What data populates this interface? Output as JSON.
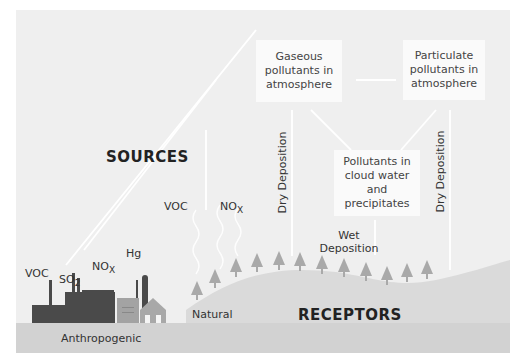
{
  "diagram": {
    "title_sources": "SOURCES",
    "title_receptors": "RECEPTORS",
    "boxes": {
      "gaseous": "Gaseous pollutants in atmosphere",
      "particulate": "Particulate pollutants in atmosphere",
      "cloud": "Pollutants in cloud water and precipitates"
    },
    "deposition": {
      "dry_left": "Dry Deposition",
      "dry_right": "Dry Deposition",
      "wet_line1": "Wet",
      "wet_line2": "Deposition"
    },
    "emissions": {
      "anthropogenic": {
        "voc": "VOC",
        "so2_base": "SO",
        "so2_sub": "2",
        "nox_base": "NO",
        "nox_sub": "X",
        "hg": "Hg"
      },
      "natural": {
        "voc": "VOC",
        "nox_base": "NO",
        "nox_sub": "X"
      }
    },
    "ground_labels": {
      "anthropogenic": "Anthropogenic",
      "natural": "Natural"
    },
    "colors": {
      "background": "#efefef",
      "ground": "#d4d4d4",
      "hill": "#dcdcdc",
      "tree": "#a8a8a8",
      "factory": "#4a4a4a",
      "plant": "#a0a0a0",
      "arrow": "#ffffff",
      "box": "#fafafa"
    }
  }
}
